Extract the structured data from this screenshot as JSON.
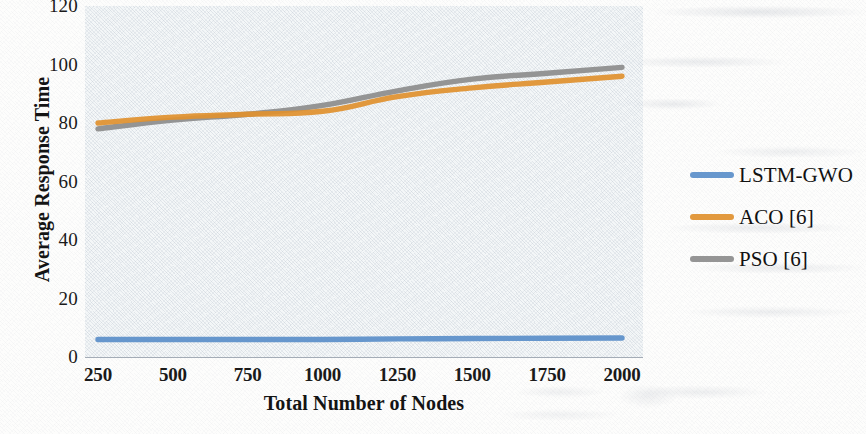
{
  "chart_data": {
    "type": "line",
    "title": "",
    "subtitle": "",
    "xlabel": "Total Number of Nodes",
    "ylabel": "Average Response Time",
    "x": [
      250,
      500,
      750,
      1000,
      1250,
      1500,
      1750,
      2000
    ],
    "xtick_labels": [
      "250",
      "500",
      "750",
      "1000",
      "1250",
      "1500",
      "1750",
      "2000"
    ],
    "ytick_labels": [
      "0",
      "20",
      "40",
      "60",
      "80",
      "100",
      "120"
    ],
    "ytick_values": [
      0,
      20,
      40,
      60,
      80,
      100,
      120
    ],
    "xlim": [
      250,
      2000
    ],
    "ylim": [
      0,
      120
    ],
    "grid": false,
    "legend_position": "right",
    "series": [
      {
        "name": "LSTM-GWO",
        "color": "#5b8fc9",
        "values": [
          6,
          6,
          6,
          6,
          6.2,
          6.3,
          6.4,
          6.5
        ]
      },
      {
        "name": "ACO [6]",
        "color": "#e0912f",
        "values": [
          80,
          82,
          83,
          84,
          89,
          92,
          94,
          96
        ]
      },
      {
        "name": "PSO [6]",
        "color": "#8d8d8d",
        "values": [
          78,
          81,
          83,
          86,
          91,
          95,
          97,
          99
        ]
      }
    ]
  },
  "legend": {
    "items": [
      {
        "label": "LSTM-GWO",
        "color": "#5b8fc9"
      },
      {
        "label": "ACO [6]",
        "color": "#e0912f"
      },
      {
        "label": "PSO [6]",
        "color": "#8d8d8d"
      }
    ]
  }
}
